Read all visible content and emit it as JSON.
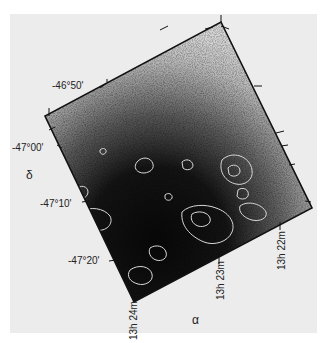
{
  "figure": {
    "type": "astronomical image with overlaid contours",
    "dec_axis": {
      "symbol": "δ",
      "ticks": [
        "-46°50'",
        "-47°00'",
        "-47°10'",
        "-47°20'"
      ]
    },
    "ra_axis": {
      "symbol": "α",
      "ticks": [
        "13h 24m",
        "13h 23m",
        "13h 22m"
      ]
    },
    "colors": {
      "background": "#ececec",
      "frame": "#111111",
      "contours": "#d8d8d8"
    }
  }
}
